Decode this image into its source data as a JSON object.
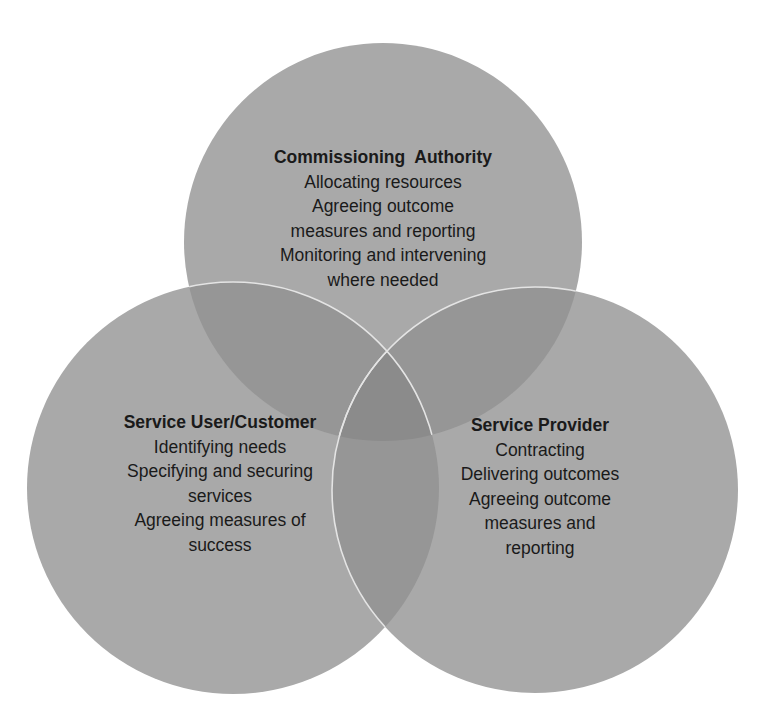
{
  "diagram": {
    "type": "venn",
    "colors": {
      "background": "#ffffff",
      "circle_fill": "#a8a8a8",
      "overlap_two": "#959595",
      "overlap_three": "#8a8a8a",
      "stroke": "#e6e6e6",
      "text": "#1a1a1a"
    },
    "circles": [
      {
        "id": "commissioning-authority",
        "title": "Commissioning  Authority",
        "lines": [
          "Allocating resources",
          "Agreeing outcome",
          "measures and reporting",
          "Monitoring and intervening",
          "where needed"
        ]
      },
      {
        "id": "service-user",
        "title": "Service User/Customer",
        "lines": [
          "Identifying needs",
          "Specifying and securing",
          "services",
          "Agreeing measures of",
          "success"
        ]
      },
      {
        "id": "service-provider",
        "title": "Service Provider",
        "lines": [
          "Contracting",
          "Delivering outcomes",
          "Agreeing outcome",
          "measures and",
          "reporting"
        ]
      }
    ]
  }
}
